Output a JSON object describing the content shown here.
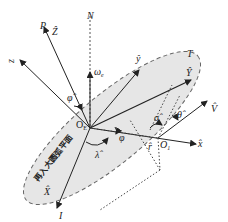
{
  "diagram": {
    "plane_label": "再入大圆弧平面",
    "points": {
      "origin_earth": "O",
      "origin_earth_sub": "E",
      "origin_vehicle": "O",
      "origin_vehicle_sub": "1",
      "north": "N",
      "pole": "P",
      "target": "T",
      "entry": "I"
    },
    "vectors": {
      "Z_hat": "Ẑ",
      "Y_hat": "Ŷ",
      "X_hat": "X̂",
      "y_hat": "ŷ",
      "x_hat": "x̂",
      "z": "z",
      "V_hat": "V̂",
      "r_hat": "r̂",
      "omega": "ω",
      "omega_sub": "e"
    },
    "angles": {
      "phi_hat": "φ̂",
      "phi": "φ",
      "lambda_hat": "λ̂",
      "sigma_hat": "σ̂",
      "theta_hat": "θ̂"
    },
    "colors": {
      "plane_fill": "#e6e6e6",
      "line": "#333333"
    }
  }
}
